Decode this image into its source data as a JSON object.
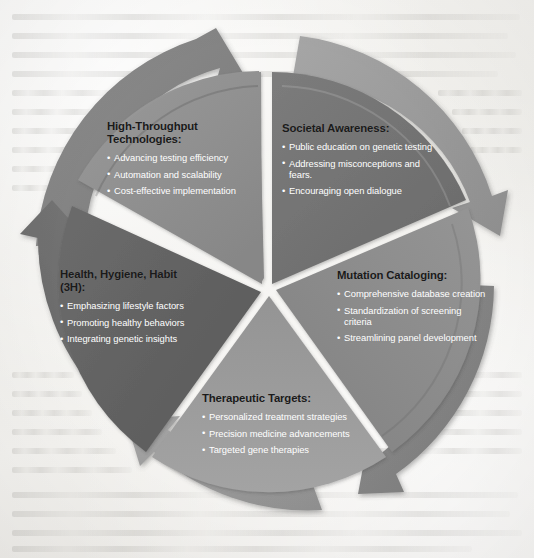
{
  "diagram": {
    "type": "cycle-wheel",
    "segment_count": 5,
    "center": {
      "x": 267,
      "y": 290
    },
    "colors": {
      "background_paper": "#f3f2ef",
      "divider": "#ffffff",
      "heading_text": "#1a1a1a",
      "bullet_text": "#ffffff",
      "segment_high_throughput": "#8e8e8e",
      "segment_societal_awareness": "#717171",
      "segment_mutation_cataloging": "#8a8a8a",
      "segment_therapeutic_targets": "#9a9a9a",
      "segment_3h": "#5f5f5f",
      "arrow_band_light": "#9b9b9b",
      "arrow_band_dark": "#6e6e6e"
    },
    "segments": [
      {
        "id": "high-throughput-technologies",
        "title": "High-Throughput Technologies:",
        "title_lines": [
          "High-Throughput",
          "Technologies:"
        ],
        "bullets": [
          "Advancing testing efficiency",
          "Automation and scalability",
          "Cost-effective implementation"
        ],
        "fill": "#8e8e8e",
        "arrow_direction": "clockwise"
      },
      {
        "id": "societal-awareness",
        "title": "Societal Awareness:",
        "title_lines": [
          "Societal Awareness:"
        ],
        "bullets": [
          "Public education on genetic testing",
          "Addressing misconceptions and fears.",
          "Encouraging open dialogue"
        ],
        "fill": "#717171",
        "arrow_direction": "clockwise"
      },
      {
        "id": "mutation-cataloging",
        "title": "Mutation Cataloging:",
        "title_lines": [
          "Mutation Cataloging:"
        ],
        "bullets": [
          "Comprehensive database creation",
          "Standardization of screening criteria",
          "Streamlining panel development"
        ],
        "fill": "#8a8a8a",
        "arrow_direction": "clockwise"
      },
      {
        "id": "therapeutic-targets",
        "title": "Therapeutic Targets:",
        "title_lines": [
          "Therapeutic Targets:"
        ],
        "bullets": [
          "Personalized treatment strategies",
          "Precision medicine advancements",
          "Targeted gene therapies"
        ],
        "fill": "#9a9a9a",
        "arrow_direction": "counter-clockwise"
      },
      {
        "id": "health-hygiene-habit-3h",
        "title": "Health, Hygiene, Habit (3H):",
        "title_lines": [
          "Health, Hygiene, Habit",
          "(3H):"
        ],
        "bullets": [
          "Emphasizing lifestyle factors",
          "Promoting healthy behaviors",
          "Integrating genetic insights"
        ],
        "fill": "#5f5f5f",
        "arrow_direction": "counter-clockwise"
      }
    ]
  }
}
